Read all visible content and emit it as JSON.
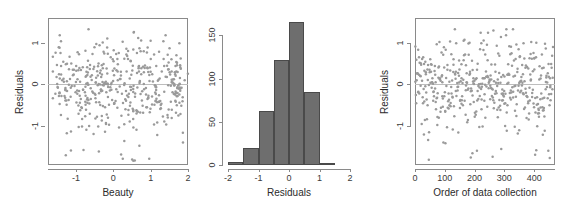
{
  "figure": {
    "background": "#ffffff",
    "point_color": "#9a9a9a",
    "bar_color": "#6e6e6e",
    "bar_border_color": "#4a4a4a",
    "axis_color": "#8a8a8a",
    "zero_line_color": "#bdbdbd"
  },
  "chart_data": [
    {
      "type": "scatter",
      "title": "",
      "xlabel": "Beauty",
      "ylabel": "Residuals",
      "xlim": [
        -1.75,
        2.0
      ],
      "ylim": [
        -1.95,
        1.6
      ],
      "xticks": [
        -1,
        0,
        1,
        2
      ],
      "xticklabels": [
        "-1",
        "0",
        "1",
        "2"
      ],
      "yticks": [
        -1,
        0,
        1
      ],
      "yticklabels": [
        "-1",
        "0",
        "1"
      ],
      "grid": false,
      "zero_line": 0,
      "n_points": 463,
      "x": [
        -1.54,
        -1.52,
        -1.49,
        -1.47,
        -1.45,
        -1.43,
        -1.41,
        -1.38,
        -1.36,
        -1.33,
        -1.31,
        -1.29,
        -1.27,
        -1.25,
        -1.23,
        -1.21,
        -1.19,
        -1.17,
        -1.15,
        -1.14,
        -1.12,
        -1.1,
        -1.08,
        -1.06,
        -1.05,
        -1.03,
        -1.01,
        -0.99,
        -0.97,
        -0.96,
        -0.94,
        -0.92,
        -0.91,
        -0.89,
        -0.88,
        -0.86,
        -0.85,
        -0.83,
        -0.82,
        -0.8,
        -0.79,
        -0.78,
        -0.76,
        -0.75,
        -0.74,
        -0.73,
        -0.71,
        -0.7,
        -0.69,
        -0.68,
        -0.67,
        -0.66,
        -0.65,
        -0.64,
        -0.63,
        -0.62,
        -0.61,
        -0.6,
        -0.59,
        -0.58,
        -0.57,
        -0.56,
        -0.55,
        -0.54,
        -0.53,
        -0.52,
        -0.51,
        -0.5,
        -0.49,
        -0.48,
        -0.47,
        -0.46,
        -0.45,
        -0.44,
        -0.43,
        -0.43,
        -0.42,
        -0.41,
        -0.4,
        -0.39,
        -0.38,
        -0.37,
        -0.36,
        -0.35,
        -0.34,
        -0.33,
        -0.32,
        -0.31,
        -0.3,
        -0.29,
        -0.28,
        -0.27,
        -0.26,
        -0.25,
        -0.24,
        -0.23,
        -0.22,
        -0.21,
        -0.2,
        -0.19,
        -0.18,
        -0.17,
        -0.16,
        -0.15,
        -0.14,
        -0.13,
        -0.12,
        -0.11,
        -0.1,
        -0.09,
        -0.08,
        -0.07,
        -0.06,
        -0.05,
        -0.04,
        -0.03,
        -0.02,
        -0.01,
        0.0,
        0.01,
        0.02,
        0.03,
        0.04,
        0.05,
        0.06,
        0.07,
        0.08,
        0.09,
        0.1,
        0.11,
        0.12,
        0.13,
        0.14,
        0.15,
        0.16,
        0.17,
        0.18,
        0.19,
        0.2,
        0.21,
        0.22,
        0.23,
        0.24,
        0.25,
        0.26,
        0.27,
        0.28,
        0.29,
        0.3,
        0.31,
        0.32,
        0.33,
        0.34,
        0.35,
        0.36,
        0.37,
        0.38,
        0.39,
        0.4,
        0.41,
        0.42,
        0.43,
        0.44,
        0.45,
        0.46,
        0.47,
        0.48,
        0.49,
        0.5,
        0.51,
        0.52,
        0.53,
        0.54,
        0.55,
        0.56,
        0.57,
        0.58,
        0.59,
        0.6,
        0.61,
        0.62,
        0.63,
        0.64,
        0.65,
        0.66,
        0.67,
        0.68,
        0.69,
        0.7,
        0.71,
        0.72,
        0.73,
        0.74,
        0.75,
        0.76,
        0.77,
        0.78,
        0.79,
        0.8,
        0.82,
        0.83,
        0.84,
        0.85,
        0.87,
        0.88,
        0.89,
        0.91,
        0.92,
        0.94,
        0.95,
        0.97,
        0.98,
        1.0,
        1.02,
        1.03,
        1.05,
        1.07,
        1.09,
        1.11,
        1.13,
        1.15,
        1.17,
        1.19,
        1.22,
        1.24,
        1.27,
        1.3,
        1.33,
        1.36,
        1.4,
        1.44,
        1.48,
        1.53,
        1.58,
        1.64,
        1.7,
        1.77,
        1.85,
        1.93
      ],
      "note_x": "x values are jittered beauty scores spanning about -1.6 to 2.0",
      "y_summary": {
        "mean": -0.01,
        "sd": 0.55,
        "min": -1.85,
        "max": 1.35
      }
    },
    {
      "type": "bar",
      "subtype": "histogram",
      "title": "",
      "xlabel": "Residuals",
      "ylabel": "",
      "xlim": [
        -2.0,
        2.0
      ],
      "ylim": [
        0,
        170
      ],
      "xticks": [
        -2,
        -1,
        0,
        1,
        2
      ],
      "xticklabels": [
        "-2",
        "-1",
        "0",
        "1",
        "2"
      ],
      "yticks": [
        0,
        50,
        100,
        150
      ],
      "yticklabels": [
        "0",
        "50",
        "100",
        "150"
      ],
      "grid": false,
      "bin_width": 0.5,
      "bin_edges": [
        -2.0,
        -1.5,
        -1.0,
        -0.5,
        0.0,
        0.5,
        1.0,
        1.5
      ],
      "categories": [
        "-2.0 to -1.5",
        "-1.5 to -1.0",
        "-1.0 to -0.5",
        "-0.5 to 0.0",
        "0.0 to 0.5",
        "0.5 to 1.0",
        "1.0 to 1.5"
      ],
      "values": [
        3,
        20,
        62,
        122,
        165,
        85,
        2
      ]
    },
    {
      "type": "scatter",
      "title": "",
      "xlabel": "Order of data collection",
      "ylabel": "Residuals",
      "xlim": [
        0,
        470
      ],
      "ylim": [
        -1.95,
        1.6
      ],
      "xticks": [
        0,
        100,
        200,
        300,
        400
      ],
      "xticklabels": [
        "0",
        "100",
        "200",
        "300",
        "400"
      ],
      "yticks": [
        -1,
        0,
        1
      ],
      "yticklabels": [
        "-1",
        "0",
        "1"
      ],
      "grid": false,
      "zero_line": 0,
      "n_points": 463,
      "x_range": [
        1,
        463
      ],
      "y_summary": {
        "mean": -0.01,
        "sd": 0.55,
        "min": -1.85,
        "max": 1.35
      }
    }
  ]
}
